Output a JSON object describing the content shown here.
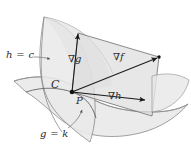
{
  "figure": {
    "width": 191,
    "height": 150,
    "background_color": "#ffffff"
  },
  "labels": {
    "surface_h": "h = c",
    "surface_g": "g = k",
    "curve": "C",
    "point": "P",
    "grad_g": "∇g",
    "grad_f": "∇f",
    "grad_h": "∇h"
  },
  "colors": {
    "outline": "#6e6e6e",
    "surface_fill": "#e9e9e9",
    "plane_fill": "#e3e3e3",
    "vector": "#1a1a1a",
    "label_text": "#2b2b2b",
    "leader_line": "#6b6b6b"
  },
  "diagram_data": {
    "type": "3d-geometry",
    "surfaces": [
      {
        "name": "level-surface-h",
        "label": "h = c",
        "shape": "saddle",
        "orientation": "vertical-curved",
        "fill": "#e9e9e9"
      },
      {
        "name": "level-surface-g",
        "label": "g = k",
        "shape": "saddle",
        "orientation": "horizontal-curved",
        "fill": "#e9e9e9"
      }
    ],
    "intersection_curve": {
      "name": "C",
      "label": "C",
      "description": "curve of intersection of the two level surfaces"
    },
    "point": {
      "name": "P",
      "label": "P",
      "x": 72,
      "y": 92,
      "description": "point on the intersection curve where gradients are evaluated"
    },
    "tangent_plane": {
      "name": "gradient-plane",
      "description": "parallelogram spanned by grad g and grad h containing grad f",
      "fill": "#e3e3e3"
    },
    "vectors": [
      {
        "name": "grad-g",
        "label": "∇g",
        "from": [
          72,
          92
        ],
        "to": [
          78,
          33
        ],
        "direction": "up"
      },
      {
        "name": "grad-f",
        "label": "∇f",
        "from": [
          72,
          92
        ],
        "to": [
          159,
          57
        ],
        "direction": "up-right"
      },
      {
        "name": "grad-h",
        "label": "∇h",
        "from": [
          72,
          92
        ],
        "to": [
          147,
          100
        ],
        "direction": "right"
      }
    ],
    "leader_lines": [
      {
        "name": "leader-h",
        "label": "h = c",
        "from": [
          34,
          56
        ],
        "to": [
          51,
          59
        ]
      },
      {
        "name": "leader-g",
        "label": "g = k",
        "from": [
          70,
          127
        ],
        "to": [
          82,
          110
        ]
      }
    ]
  }
}
